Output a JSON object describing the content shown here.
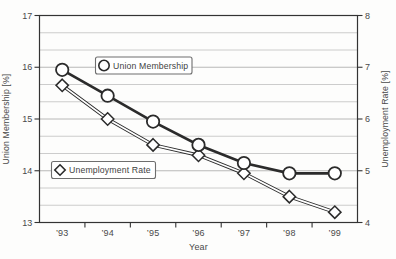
{
  "figure": {
    "background": "#fdfdfc"
  },
  "chart_data": {
    "type": "line",
    "title": "",
    "xlabel": "Year",
    "categories": [
      "’93",
      "’94",
      "’95",
      "’96",
      "’97",
      "’98",
      "’99"
    ],
    "axes": {
      "left": {
        "label": "Union Membership [%]",
        "min": 13,
        "max": 17,
        "major_ticks": [
          17,
          16,
          15,
          14,
          13
        ],
        "minor_divisions_per_major": 3
      },
      "right": {
        "label": "Unemployment Rate [%]",
        "min": 4,
        "max": 8,
        "major_ticks": [
          8,
          7,
          6,
          5,
          4
        ]
      }
    },
    "series": [
      {
        "name": "Union Membership",
        "axis": "left",
        "marker": "circle",
        "line": "solid",
        "values": [
          15.95,
          15.45,
          14.95,
          14.5,
          14.15,
          13.95,
          13.95
        ]
      },
      {
        "name": "Unemployment Rate",
        "axis": "right",
        "marker": "diamond",
        "line": "double",
        "values": [
          6.65,
          6.0,
          5.5,
          5.3,
          4.95,
          4.5,
          4.2
        ]
      }
    ],
    "legend": {
      "position": "inside-plot",
      "entries": [
        {
          "label": "Union Membership",
          "marker": "circle"
        },
        {
          "label": "Unemployment Rate",
          "marker": "diamond"
        }
      ]
    },
    "grid": {
      "horizontal": true,
      "vertical": false
    },
    "ylim_left": [
      13,
      17
    ],
    "ylim_right": [
      4,
      8
    ],
    "colors": {
      "stroke": "#2b2b2b",
      "marker_fill": "#ffffff",
      "grid_major": "#b0b0b0",
      "grid_minor": "#c6c6c6",
      "frame": "#333333",
      "text": "#4a4a4a",
      "legend_border": "#6e6e6e",
      "background": "#fdfdfc"
    }
  }
}
